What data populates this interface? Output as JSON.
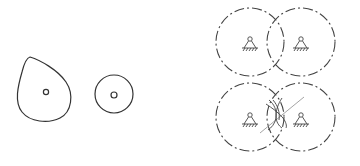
{
  "diagram": {
    "colors": {
      "line": "#333333",
      "dashed": "#444444",
      "line_of_action": "#9a9a9a",
      "background": "#ffffff"
    },
    "shapes": {
      "cam": {
        "label": "cam-profile",
        "hole": [
          46,
          92
        ]
      },
      "disk": {
        "label": "circular-disk",
        "center": [
          114,
          94
        ],
        "radius": 19,
        "hole_radius": 3
      },
      "top_pair": {
        "left_circle": {
          "center": [
            250,
            42
          ],
          "radius": 34,
          "support": "pivot-support"
        },
        "right_circle": {
          "center": [
            301,
            42
          ],
          "radius": 34,
          "support": "pivot-support"
        }
      },
      "bottom_pair": {
        "left_circle": {
          "center": [
            250,
            117
          ],
          "radius": 34,
          "support": "pivot-support"
        },
        "right_circle": {
          "center": [
            301,
            117
          ],
          "radius": 34,
          "support": "pivot-support"
        },
        "contact_point": [
          276,
          112
        ]
      }
    }
  }
}
